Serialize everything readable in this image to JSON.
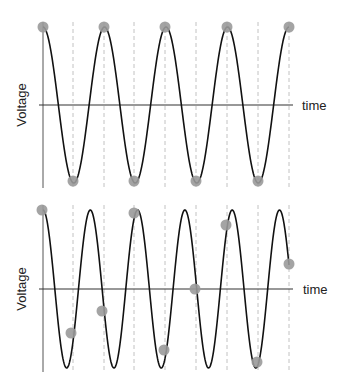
{
  "chart_data": [
    {
      "type": "line",
      "title": "",
      "xlabel": "time",
      "ylabel": "Voltage",
      "description": "Sine wave sampled at exactly its peaks and troughs (sampling at twice the signal frequency)",
      "axis": {
        "x_start": 43,
        "x_end": 293,
        "y_center": 105,
        "y_top": 22,
        "y_bottom": 188
      },
      "wave": {
        "x_start": 43,
        "x_end": 289,
        "center_y": 105,
        "amplitude": 78,
        "period": 61.5,
        "phase": "cos"
      },
      "sample_lines_x": [
        73,
        104,
        134,
        165,
        196,
        227,
        258,
        289
      ],
      "samples": [
        {
          "x": 43,
          "y": 27
        },
        {
          "x": 73,
          "y": 181
        },
        {
          "x": 104,
          "y": 27
        },
        {
          "x": 134,
          "y": 181
        },
        {
          "x": 165,
          "y": 27
        },
        {
          "x": 196,
          "y": 181
        },
        {
          "x": 227,
          "y": 27
        },
        {
          "x": 258,
          "y": 181
        },
        {
          "x": 289,
          "y": 27
        }
      ]
    },
    {
      "type": "line",
      "title": "",
      "xlabel": "time",
      "ylabel": "Voltage",
      "description": "Higher-frequency sine wave sampled at the same rate; samples land at varying points (aliasing)",
      "axis": {
        "x_start": 43,
        "x_end": 293,
        "y_center": 289,
        "y_top": 205,
        "y_bottom": 372
      },
      "wave": {
        "x_start": 43,
        "x_end": 289,
        "center_y": 289,
        "amplitude": 79,
        "period": 47.3,
        "phase": "cos"
      },
      "sample_lines_x": [
        73,
        104,
        134,
        165,
        196,
        227,
        258,
        289
      ],
      "samples": [
        {
          "x": 42,
          "y": 210
        },
        {
          "x": 71,
          "y": 333
        },
        {
          "x": 102,
          "y": 311
        },
        {
          "x": 134,
          "y": 213
        },
        {
          "x": 164,
          "y": 350
        },
        {
          "x": 195,
          "y": 289
        },
        {
          "x": 226,
          "y": 225
        },
        {
          "x": 257,
          "y": 362
        },
        {
          "x": 289,
          "y": 264
        }
      ]
    }
  ],
  "labels": {
    "top_ylabel": "Voltage",
    "top_xlabel": "time",
    "bottom_ylabel": "Voltage",
    "bottom_xlabel": "time"
  },
  "colors": {
    "wave": "#111111",
    "axis": "#333333",
    "grid": "#bbbbbb",
    "sample_dot": "#9a9a9a"
  }
}
